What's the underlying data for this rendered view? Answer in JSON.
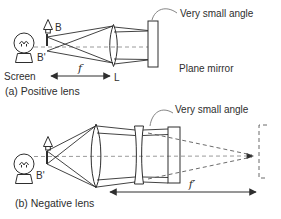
{
  "figure": {
    "background": "#ffffff",
    "colors": {
      "ink": "#2e2e2e",
      "dash": "#8f8f8f",
      "lens_fill": "#e2e2e2",
      "mirror_fill": "#c9c9c9",
      "leader": "#767676"
    }
  },
  "panel_a": {
    "caption": "(a)  Positive lens",
    "labels": {
      "object_top": "B",
      "object_image": "B'",
      "screen": "Screen",
      "focal_length": "f",
      "lens": "L",
      "angle_note": "Very small angle",
      "mirror": "Plane mirror"
    }
  },
  "panel_b": {
    "caption": "(b)  Negative lens",
    "labels": {
      "object_image": "B'",
      "focal_length": "f′",
      "angle_note": "Very small angle"
    }
  }
}
